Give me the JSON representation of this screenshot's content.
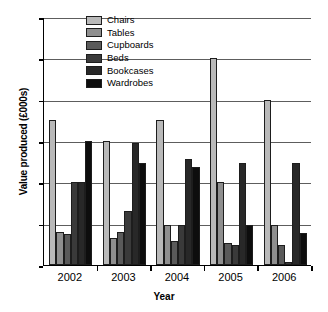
{
  "chart_data": {
    "type": "bar",
    "title": "",
    "xlabel": "Year",
    "ylabel": "Value produced (£000s)",
    "categories": [
      "2002",
      "2003",
      "2004",
      "2005",
      "2006"
    ],
    "ylim": [
      0,
      600
    ],
    "yticks": [
      0,
      100,
      200,
      300,
      400,
      500,
      600
    ],
    "ytick_labels": [
      "0",
      "100",
      "200",
      "300",
      "400",
      "500",
      "600"
    ],
    "grid": true,
    "legend_position": "top-center",
    "series": [
      {
        "name": "Chairs",
        "color": "#b9b9b9",
        "values": [
          350,
          300,
          350,
          500,
          400
        ]
      },
      {
        "name": "Tables",
        "color": "#8f8f8f",
        "values": [
          80,
          65,
          98,
          200,
          98
        ]
      },
      {
        "name": "Cupboards",
        "color": "#5a5a5a",
        "values": [
          75,
          80,
          58,
          53,
          48
        ]
      },
      {
        "name": "Beds",
        "color": "#3a3a3a",
        "values": [
          200,
          130,
          98,
          48,
          8
        ]
      },
      {
        "name": "Bookcases",
        "color": "#282828",
        "values": [
          200,
          295,
          257,
          248,
          248
        ]
      },
      {
        "name": "Wardrobes",
        "color": "#0d0d0d",
        "values": [
          300,
          248,
          238,
          98,
          78
        ]
      }
    ]
  }
}
